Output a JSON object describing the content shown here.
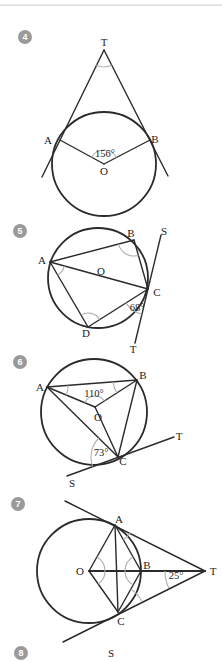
{
  "colors": {
    "line": "#2b2b2b",
    "angle_arc": "#b0b0b0",
    "badge": "#9a9a9a",
    "label": "#1c1c1c",
    "top_rule": "#dcdcdc"
  },
  "d4": {
    "number": "4",
    "T": "T",
    "A": "A",
    "B": "B",
    "O": "O",
    "angle_O": "156°"
  },
  "d5": {
    "number": "5",
    "A": "A",
    "B": "B",
    "C": "C",
    "D": "D",
    "O": "O",
    "S": "S",
    "T": "T",
    "angle_C": "68°"
  },
  "d6": {
    "number": "6",
    "A": "A",
    "B": "B",
    "C": "C",
    "O": "O",
    "S": "S",
    "T": "T",
    "angle_O": "110°",
    "angle_C": "73°"
  },
  "d7": {
    "number": "7",
    "O": "O",
    "A": "A",
    "B": "B",
    "C": "C",
    "T": "T",
    "angle_T": "25°"
  },
  "d8": {
    "number": "8",
    "S": "S"
  }
}
